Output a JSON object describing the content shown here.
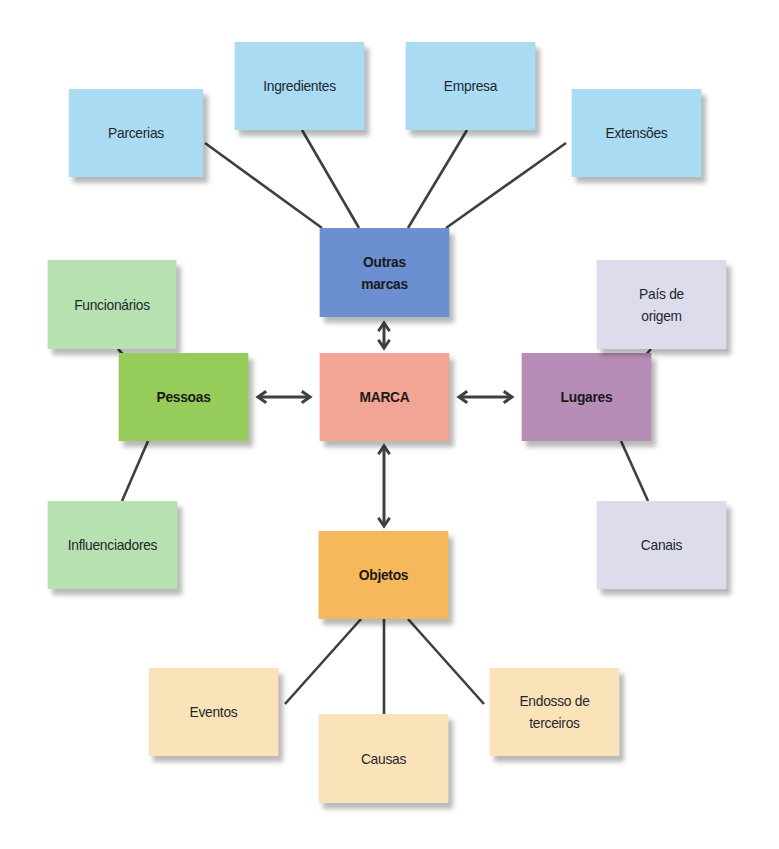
{
  "diagram": {
    "title": "",
    "colors": {
      "outras_marcas_group": "#a9dcf2",
      "outras_marcas_hub": "#6b8fd1",
      "pessoas_group": "#b7e1b1",
      "pessoas_hub": "#96cd5a",
      "marca_center": "#f2a594",
      "lugares_group": "#dcdced",
      "lugares_hub": "#b68db7",
      "objetos_group": "#fbe3b9",
      "objetos_hub": "#f6b85b",
      "connector": "#3f3f3f"
    },
    "nodes": [
      {
        "id": "parcerias",
        "label": "Parcerias",
        "x": 63,
        "y": 89,
        "w": 146,
        "h": 88,
        "fill": "#a9dcf2",
        "bold": false
      },
      {
        "id": "ingredientes",
        "label": "Ingredientes",
        "x": 229,
        "y": 42,
        "w": 141,
        "h": 88,
        "fill": "#a9dcf2",
        "bold": false
      },
      {
        "id": "empresa",
        "label": "Empresa",
        "x": 400,
        "y": 42,
        "w": 141,
        "h": 88,
        "fill": "#a9dcf2",
        "bold": false
      },
      {
        "id": "extensoes",
        "label": "Extensões",
        "x": 566,
        "y": 89,
        "w": 141,
        "h": 88,
        "fill": "#a9dcf2",
        "bold": false
      },
      {
        "id": "outras-marcas",
        "label": "Outras\nmarcas",
        "x": 314,
        "y": 228,
        "w": 141,
        "h": 89,
        "fill": "#6b8fd1",
        "bold": true
      },
      {
        "id": "funcionarios",
        "label": "Funcionários",
        "x": 42,
        "y": 260,
        "w": 140,
        "h": 89,
        "fill": "#b7e1b1",
        "bold": false
      },
      {
        "id": "pessoas",
        "label": "Pessoas",
        "x": 113,
        "y": 353,
        "w": 141,
        "h": 88,
        "fill": "#96cd5a",
        "bold": true
      },
      {
        "id": "marca",
        "label": "MARCA",
        "x": 314,
        "y": 353,
        "w": 141,
        "h": 88,
        "fill": "#f2a594",
        "bold": true
      },
      {
        "id": "lugares",
        "label": "Lugares",
        "x": 516,
        "y": 353,
        "w": 141,
        "h": 88,
        "fill": "#b68db7",
        "bold": true
      },
      {
        "id": "pais-de-origem",
        "label": "País de\norigem",
        "x": 591,
        "y": 260,
        "w": 141,
        "h": 89,
        "fill": "#dcdced",
        "bold": false
      },
      {
        "id": "influenciadores",
        "label": "Influenciadores",
        "x": 42,
        "y": 501,
        "w": 141,
        "h": 88,
        "fill": "#b7e1b1",
        "bold": false
      },
      {
        "id": "canais",
        "label": "Canais",
        "x": 591,
        "y": 501,
        "w": 141,
        "h": 88,
        "fill": "#dcdced",
        "bold": false
      },
      {
        "id": "objetos",
        "label": "Objetos",
        "x": 313,
        "y": 531,
        "w": 141,
        "h": 88,
        "fill": "#f6b85b",
        "bold": true
      },
      {
        "id": "eventos",
        "label": "Eventos",
        "x": 143,
        "y": 668,
        "w": 141,
        "h": 88,
        "fill": "#fbe3b9",
        "bold": false
      },
      {
        "id": "causas",
        "label": "Causas",
        "x": 313,
        "y": 714,
        "w": 141,
        "h": 89,
        "fill": "#fbe3b9",
        "bold": false
      },
      {
        "id": "endosso-de-terceiros",
        "label": "Endosso de\nterceiros",
        "x": 484,
        "y": 668,
        "w": 141,
        "h": 88,
        "fill": "#fbe3b9",
        "bold": false
      }
    ],
    "lines": [
      {
        "from": "parcerias",
        "to": "outras-marcas",
        "x1": 205,
        "y1": 143,
        "x2": 322,
        "y2": 228
      },
      {
        "from": "ingredientes",
        "to": "outras-marcas",
        "x1": 302,
        "y1": 130,
        "x2": 359,
        "y2": 228
      },
      {
        "from": "empresa",
        "to": "outras-marcas",
        "x1": 467,
        "y1": 130,
        "x2": 408,
        "y2": 228
      },
      {
        "from": "extensoes",
        "to": "outras-marcas",
        "x1": 566,
        "y1": 143,
        "x2": 446,
        "y2": 228
      },
      {
        "from": "funcionarios",
        "to": "pessoas",
        "x1": 118,
        "y1": 349,
        "x2": 145,
        "y2": 378
      },
      {
        "from": "pessoas",
        "to": "influenciadores",
        "x1": 148,
        "y1": 441,
        "x2": 122,
        "y2": 501
      },
      {
        "from": "pais-de-origem",
        "to": "lugares",
        "x1": 651,
        "y1": 349,
        "x2": 623,
        "y2": 381
      },
      {
        "from": "lugares",
        "to": "canais",
        "x1": 621,
        "y1": 441,
        "x2": 648,
        "y2": 501
      },
      {
        "from": "objetos",
        "to": "eventos",
        "x1": 361,
        "y1": 619,
        "x2": 285,
        "y2": 704
      },
      {
        "from": "objetos",
        "to": "causas",
        "x1": 384,
        "y1": 619,
        "x2": 384,
        "y2": 714
      },
      {
        "from": "objetos",
        "to": "endosso-de-terceiros",
        "x1": 408,
        "y1": 619,
        "x2": 484,
        "y2": 704
      }
    ],
    "arrows": [
      {
        "from": "marca",
        "to": "outras-marcas",
        "x1": 384,
        "y1": 323,
        "x2": 384,
        "y2": 348,
        "bidirectional": true
      },
      {
        "from": "marca",
        "to": "pessoas",
        "x1": 258,
        "y1": 397,
        "x2": 310,
        "y2": 397,
        "bidirectional": true
      },
      {
        "from": "marca",
        "to": "lugares",
        "x1": 459,
        "y1": 397,
        "x2": 512,
        "y2": 397,
        "bidirectional": true
      },
      {
        "from": "marca",
        "to": "objetos",
        "x1": 384,
        "y1": 446,
        "x2": 384,
        "y2": 526,
        "bidirectional": true
      }
    ]
  }
}
